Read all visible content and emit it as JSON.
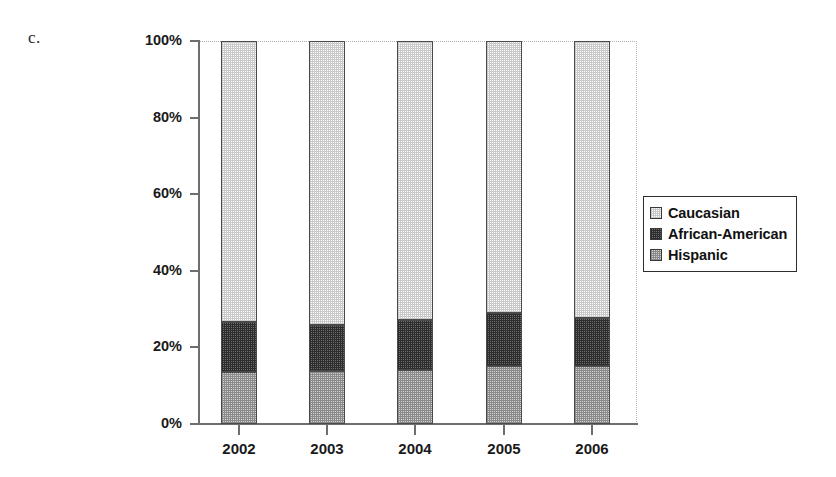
{
  "figure": {
    "label": "c."
  },
  "chart_data": {
    "type": "bar",
    "subtype": "stacked-100-percent",
    "title": "",
    "xlabel": "",
    "ylabel": "",
    "categories": [
      "2002",
      "2003",
      "2004",
      "2005",
      "2006"
    ],
    "ylim": [
      0,
      100
    ],
    "ytick_labels": [
      "0%",
      "20%",
      "40%",
      "60%",
      "80%",
      "100%"
    ],
    "ytick_values": [
      0,
      20,
      40,
      60,
      80,
      100
    ],
    "grid": false,
    "legend_position": "right",
    "series": [
      {
        "name": "Caucasian",
        "color": "#e2e2e2",
        "pattern": "light-checker",
        "values": [
          73.4,
          74.2,
          72.8,
          71.1,
          72.4
        ]
      },
      {
        "name": "African-American",
        "color": "#5a5a5a",
        "pattern": "dark-checker",
        "values": [
          13.0,
          12.0,
          13.1,
          13.8,
          12.5
        ]
      },
      {
        "name": "Hispanic",
        "color": "#c6c6c6",
        "pattern": "medium-checker",
        "values": [
          13.6,
          13.8,
          14.1,
          15.1,
          15.1
        ]
      }
    ]
  },
  "legend": {
    "items": [
      {
        "label": "Caucasian",
        "swatch": "light-checker"
      },
      {
        "label": "African-American",
        "swatch": "dark-checker"
      },
      {
        "label": "Hispanic",
        "swatch": "medium-checker"
      }
    ]
  }
}
